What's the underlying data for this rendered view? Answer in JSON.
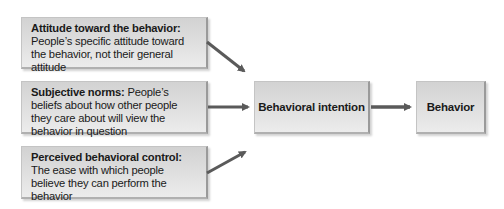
{
  "diagram": {
    "inputs": [
      {
        "term": "Attitude toward the behavior:",
        "definition": " People’s specific attitude toward the behavior, not their general attitude"
      },
      {
        "term": "Subjective norms:",
        "definition": " People’s beliefs about how other people they care about will view the behavior in question"
      },
      {
        "term": "Perceived behavioral control:",
        "definition": " The ease with which people believe they can perform the behavior"
      }
    ],
    "intention": {
      "label": "Behavioral intention"
    },
    "outcome": {
      "label": "Behavior"
    },
    "colors": {
      "box_fill": "#dcdcdc",
      "arrow": "#5a5a5a",
      "text": "#1a1a1a"
    }
  }
}
